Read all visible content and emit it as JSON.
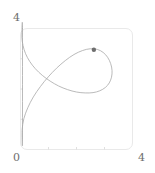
{
  "figure": {
    "background_color": "#ffffff",
    "frame_color": "#e9e9e9",
    "curve_color": "#a8a8a8",
    "tick_color": "#d8d8d8",
    "marker_color": "#6e6e6e",
    "label_color": "#6e6e6e"
  },
  "labels": {
    "y_max": "4",
    "origin": "0",
    "x_max": "4"
  },
  "chart_data": {
    "type": "line",
    "title": "",
    "xlabel": "",
    "ylabel": "",
    "xlim": [
      0,
      4
    ],
    "ylim": [
      0,
      4
    ],
    "grid": false,
    "legend": false,
    "tick_labels_x": [
      "0",
      "4"
    ],
    "tick_labels_y": [
      "0",
      "4"
    ],
    "x_ticks": [
      0,
      1,
      2,
      3,
      4
    ],
    "y_ticks": [
      0,
      1,
      2,
      3,
      4
    ],
    "series": [
      {
        "name": "parametric-loop",
        "style": "closed-loop-with-cusp",
        "x": [
          0.07,
          0.05,
          0.09,
          0.18,
          0.33,
          0.53,
          0.78,
          1.06,
          1.36,
          1.68,
          2.0,
          2.31,
          2.59,
          2.83,
          3.03,
          3.17,
          3.25,
          3.27,
          3.22,
          3.11,
          2.95,
          2.74,
          2.49,
          2.21,
          1.91,
          1.6,
          1.29,
          0.99,
          0.71,
          0.46,
          0.26,
          0.12,
          0.06,
          0.07
        ],
        "y": [
          4.0,
          3.72,
          3.44,
          3.17,
          2.91,
          2.67,
          2.45,
          2.26,
          2.1,
          1.98,
          1.9,
          1.87,
          1.88,
          1.94,
          2.05,
          2.2,
          2.39,
          2.61,
          2.84,
          3.05,
          3.21,
          3.31,
          3.33,
          3.27,
          3.14,
          2.94,
          2.69,
          2.4,
          2.08,
          1.74,
          1.38,
          1.02,
          0.66,
          0.32
        ]
      }
    ],
    "markers": [
      {
        "name": "highlight-point",
        "x": 2.62,
        "y": 3.3,
        "size": 2.2
      }
    ],
    "annotations": []
  }
}
